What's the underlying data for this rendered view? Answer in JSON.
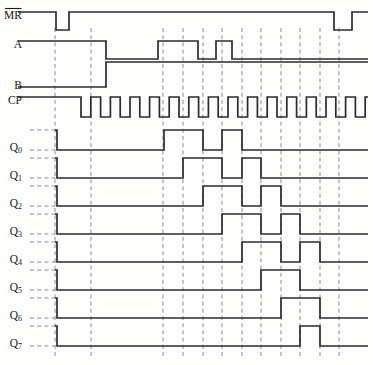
{
  "diagram": {
    "type": "digital-timing-waveform",
    "line_color": "#2b2b2b",
    "grid_color": "#8e8e8e",
    "background": "#fdfdfc",
    "width": 373,
    "height": 365,
    "time_axis": {
      "unit": "clock-cycle",
      "x_start": 55,
      "x_end": 368,
      "cycle_width": 19.6,
      "cycle_count": 16
    },
    "labels": {
      "mr": "MR",
      "mr_overbar": true,
      "a": "A",
      "b": "B",
      "cp": "CP",
      "q0": "Q",
      "q0_sub": "0",
      "q1": "Q",
      "q1_sub": "1",
      "q2": "Q",
      "q2_sub": "2",
      "q3": "Q",
      "q3_sub": "3",
      "q4": "Q",
      "q4_sub": "4",
      "q5": "Q",
      "q5_sub": "5",
      "q6": "Q",
      "q6_sub": "6",
      "q7": "Q",
      "q7_sub": "7"
    },
    "gridlines_x": [
      55,
      91,
      163,
      183,
      203,
      222,
      242,
      261,
      281,
      300,
      320,
      339
    ],
    "signals": [
      {
        "name": "MR",
        "label": "MR",
        "active_low": true,
        "row_top": 12,
        "row_bottom": 30,
        "label_x": 22,
        "label_y": 16,
        "has_left_dash": false,
        "transitions": [
          {
            "x": 18,
            "level": 1
          },
          {
            "x": 56,
            "level": 0
          },
          {
            "x": 69,
            "level": 1
          },
          {
            "x": 334,
            "level": 0
          },
          {
            "x": 352,
            "level": 1
          },
          {
            "x": 368,
            "level": 1
          }
        ]
      },
      {
        "name": "A",
        "label": "A",
        "active_low": false,
        "row_top": 41,
        "row_bottom": 59,
        "label_x": 22,
        "label_y": 45,
        "has_left_dash": false,
        "transitions": [
          {
            "x": 18,
            "level": 1
          },
          {
            "x": 106,
            "level": 0
          },
          {
            "x": 158,
            "level": 1
          },
          {
            "x": 198,
            "level": 0
          },
          {
            "x": 216,
            "level": 1
          },
          {
            "x": 232,
            "level": 0
          },
          {
            "x": 368,
            "level": 0
          }
        ]
      },
      {
        "name": "B",
        "label": "B",
        "active_low": false,
        "row_top": 62,
        "row_bottom": 87,
        "label_x": 22,
        "label_y": 86,
        "has_left_dash": false,
        "transitions": [
          {
            "x": 18,
            "level": 0
          },
          {
            "x": 106,
            "level": 1
          },
          {
            "x": 368,
            "level": 1
          }
        ]
      },
      {
        "name": "CP",
        "label": "CP",
        "active_low": false,
        "row_top": 97,
        "row_bottom": 117,
        "label_x": 22,
        "label_y": 101,
        "has_left_dash": false,
        "clock": {
          "idle_level": 1,
          "first_edge_x": 81,
          "period": 19.6,
          "duty": 0.5,
          "pulses": 15,
          "end_x": 368
        }
      },
      {
        "name": "Q0",
        "label": "Q",
        "sub": "0",
        "row_top": 130,
        "row_bottom": 150,
        "label_x": 22,
        "label_y": 148,
        "has_left_dash": true,
        "transitions": [
          {
            "x": 55,
            "level": 1
          },
          {
            "x": 57,
            "level": 0
          },
          {
            "x": 164,
            "level": 1
          },
          {
            "x": 203,
            "level": 0
          },
          {
            "x": 222,
            "level": 1
          },
          {
            "x": 242,
            "level": 0
          },
          {
            "x": 368,
            "level": 0
          }
        ]
      },
      {
        "name": "Q1",
        "label": "Q",
        "sub": "1",
        "row_top": 158,
        "row_bottom": 178,
        "label_x": 22,
        "label_y": 176,
        "has_left_dash": true,
        "transitions": [
          {
            "x": 55,
            "level": 1
          },
          {
            "x": 57,
            "level": 0
          },
          {
            "x": 183,
            "level": 1
          },
          {
            "x": 222,
            "level": 0
          },
          {
            "x": 242,
            "level": 1
          },
          {
            "x": 261,
            "level": 0
          },
          {
            "x": 368,
            "level": 0
          }
        ]
      },
      {
        "name": "Q2",
        "label": "Q",
        "sub": "2",
        "row_top": 186,
        "row_bottom": 206,
        "label_x": 22,
        "label_y": 204,
        "has_left_dash": true,
        "transitions": [
          {
            "x": 55,
            "level": 1
          },
          {
            "x": 57,
            "level": 0
          },
          {
            "x": 203,
            "level": 1
          },
          {
            "x": 242,
            "level": 0
          },
          {
            "x": 261,
            "level": 1
          },
          {
            "x": 281,
            "level": 0
          },
          {
            "x": 368,
            "level": 0
          }
        ]
      },
      {
        "name": "Q3",
        "label": "Q",
        "sub": "3",
        "row_top": 214,
        "row_bottom": 234,
        "label_x": 22,
        "label_y": 232,
        "has_left_dash": true,
        "transitions": [
          {
            "x": 55,
            "level": 1
          },
          {
            "x": 57,
            "level": 0
          },
          {
            "x": 222,
            "level": 1
          },
          {
            "x": 261,
            "level": 0
          },
          {
            "x": 281,
            "level": 1
          },
          {
            "x": 300,
            "level": 0
          },
          {
            "x": 368,
            "level": 0
          }
        ]
      },
      {
        "name": "Q4",
        "label": "Q",
        "sub": "4",
        "row_top": 242,
        "row_bottom": 262,
        "label_x": 22,
        "label_y": 260,
        "has_left_dash": true,
        "transitions": [
          {
            "x": 55,
            "level": 1
          },
          {
            "x": 57,
            "level": 0
          },
          {
            "x": 242,
            "level": 1
          },
          {
            "x": 281,
            "level": 0
          },
          {
            "x": 300,
            "level": 1
          },
          {
            "x": 320,
            "level": 0
          },
          {
            "x": 368,
            "level": 0
          }
        ]
      },
      {
        "name": "Q5",
        "label": "Q",
        "sub": "5",
        "row_top": 270,
        "row_bottom": 290,
        "label_x": 22,
        "label_y": 288,
        "has_left_dash": true,
        "transitions": [
          {
            "x": 55,
            "level": 1
          },
          {
            "x": 57,
            "level": 0
          },
          {
            "x": 261,
            "level": 1
          },
          {
            "x": 300,
            "level": 0
          },
          {
            "x": 368,
            "level": 0
          }
        ]
      },
      {
        "name": "Q6",
        "label": "Q",
        "sub": "6",
        "row_top": 298,
        "row_bottom": 318,
        "label_x": 22,
        "label_y": 316,
        "has_left_dash": true,
        "transitions": [
          {
            "x": 55,
            "level": 1
          },
          {
            "x": 57,
            "level": 0
          },
          {
            "x": 281,
            "level": 1
          },
          {
            "x": 320,
            "level": 0
          },
          {
            "x": 368,
            "level": 0
          }
        ]
      },
      {
        "name": "Q7",
        "label": "Q",
        "sub": "7",
        "row_top": 326,
        "row_bottom": 346,
        "label_x": 22,
        "label_y": 344,
        "has_left_dash": true,
        "transitions": [
          {
            "x": 55,
            "level": 1
          },
          {
            "x": 57,
            "level": 0
          },
          {
            "x": 300,
            "level": 1
          },
          {
            "x": 320,
            "level": 0
          },
          {
            "x": 368,
            "level": 0
          }
        ]
      }
    ]
  }
}
